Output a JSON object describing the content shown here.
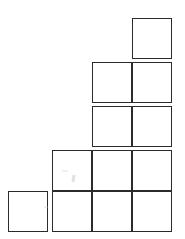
{
  "chart_data": {
    "type": "bar",
    "title": "",
    "subtitle": "",
    "xlabel": "",
    "ylabel": "",
    "categories": [
      "1",
      "2",
      "3",
      "4"
    ],
    "values": [
      1,
      2,
      4,
      5
    ],
    "unit_label": "square",
    "unit_value": 1,
    "ylim": [
      0,
      5
    ],
    "xlim": [
      0,
      4
    ],
    "grid": false,
    "legend": false,
    "legend_position": "none",
    "annotations": [],
    "tick_labels_x": [],
    "tick_labels_y": [],
    "series": [
      {
        "name": "blocks",
        "values": [
          1,
          2,
          4,
          5
        ]
      }
    ],
    "style": {
      "block_fill": "#ffffff",
      "block_stroke": "#2b2b2b",
      "background": "#ffffff",
      "block_width_px": 40,
      "block_height_px": 41,
      "block_gap_px": 3
    }
  },
  "columns": [
    {
      "index": 1,
      "count": 1,
      "left_px": 8
    },
    {
      "index": 2,
      "count": 2,
      "left_px": 52
    },
    {
      "index": 3,
      "count": 4,
      "left_px": 92
    },
    {
      "index": 4,
      "count": 5,
      "left_px": 132
    }
  ],
  "caption": ""
}
